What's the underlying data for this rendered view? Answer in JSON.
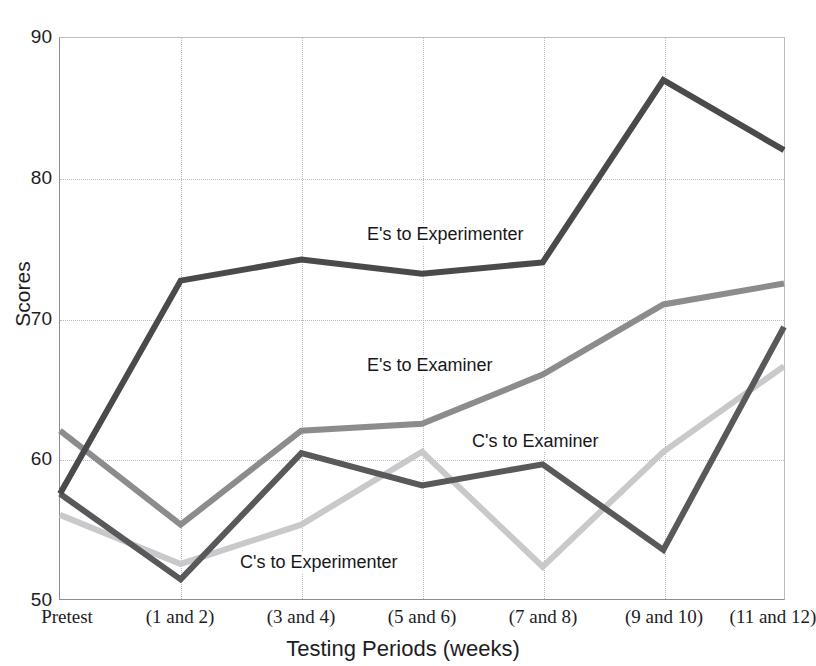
{
  "title": "",
  "axes": {
    "y_title": "Scores",
    "x_title": "Testing Periods (weeks)",
    "y_ticks": [
      "90",
      "80",
      "70",
      "60",
      "50"
    ],
    "x_ticks": [
      "Pretest",
      "(1 and 2)",
      "(3 and 4)",
      "(5 and 6)",
      "(7 and 8)",
      "(9 and 10)",
      "(11 and 12)"
    ]
  },
  "annotations": {
    "es_to_experimenter": "E's to Experimenter",
    "es_to_examiner": "E's to Examiner",
    "cs_to_examiner": "C's to Examiner",
    "cs_to_experimenter": "C's to Experimenter"
  },
  "colors": {
    "es_to_experimenter": "#4a4a4c",
    "es_to_examiner": "#8c8c8e",
    "cs_to_examiner": "#59595b",
    "cs_to_experimenter": "#c9c9cb",
    "gridline": "#b9b9be",
    "axis": "#8d8d91",
    "text": "#1d1d1f",
    "background": "#ffffff"
  },
  "chart_data": {
    "type": "line",
    "title": "",
    "xlabel": "Testing Periods (weeks)",
    "ylabel": "Scores",
    "ylim": [
      50,
      90
    ],
    "ytick_step": 10,
    "grid": true,
    "legend": "inline-labels",
    "categories": [
      "Pretest",
      "(1 and 2)",
      "(3 and 4)",
      "(5 and 6)",
      "(7 and 8)",
      "(9 and 10)",
      "(11 and 12)"
    ],
    "series": [
      {
        "name": "E's to Experimenter",
        "color": "#4a4a4c",
        "values": [
          57.5,
          72.7,
          74.2,
          73.2,
          74.0,
          87.0,
          82.0
        ]
      },
      {
        "name": "E's to Examiner",
        "color": "#8c8c8e",
        "values": [
          62.0,
          55.3,
          62.0,
          62.5,
          66.0,
          71.0,
          72.5
        ]
      },
      {
        "name": "C's to Examiner",
        "color": "#59595b",
        "values": [
          57.5,
          51.4,
          60.4,
          58.1,
          59.6,
          53.5,
          69.4
        ]
      },
      {
        "name": "C's to Experimenter",
        "color": "#c9c9cb",
        "values": [
          56.0,
          52.5,
          55.3,
          60.5,
          52.3,
          60.5,
          66.6
        ]
      }
    ]
  }
}
